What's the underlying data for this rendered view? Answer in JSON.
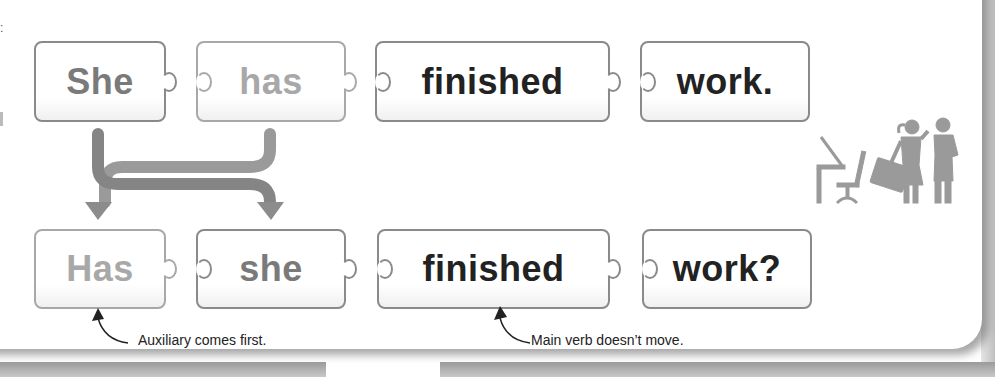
{
  "diagram": {
    "statement": {
      "pieces": [
        {
          "word": "She",
          "color": "#7a7a7a"
        },
        {
          "word": "has",
          "color": "#a8a8a8"
        },
        {
          "word": "finished",
          "color": "#222222"
        },
        {
          "word": "work.",
          "color": "#222222"
        }
      ]
    },
    "question": {
      "pieces": [
        {
          "word": "Has",
          "color": "#a8a8a8"
        },
        {
          "word": "she",
          "color": "#7a7a7a"
        },
        {
          "word": "finished",
          "color": "#222222"
        },
        {
          "word": "work?",
          "color": "#222222"
        }
      ]
    },
    "annotations": [
      {
        "text": "Auxiliary comes first.",
        "points_to": "Has"
      },
      {
        "text": "Main verb doesn’t move.",
        "points_to": "finished"
      }
    ],
    "arrows": [
      {
        "from": "She",
        "to": "she"
      },
      {
        "from": "has",
        "to": "Has"
      }
    ],
    "illustration": {
      "icon": "office-workers-icon",
      "color": "#9a9a9a"
    }
  },
  "colors": {
    "border": "#8a8a8a",
    "arrow": "#8c8c8c",
    "text_dark": "#222222",
    "text_mid": "#7a7a7a",
    "text_light": "#a8a8a8"
  }
}
